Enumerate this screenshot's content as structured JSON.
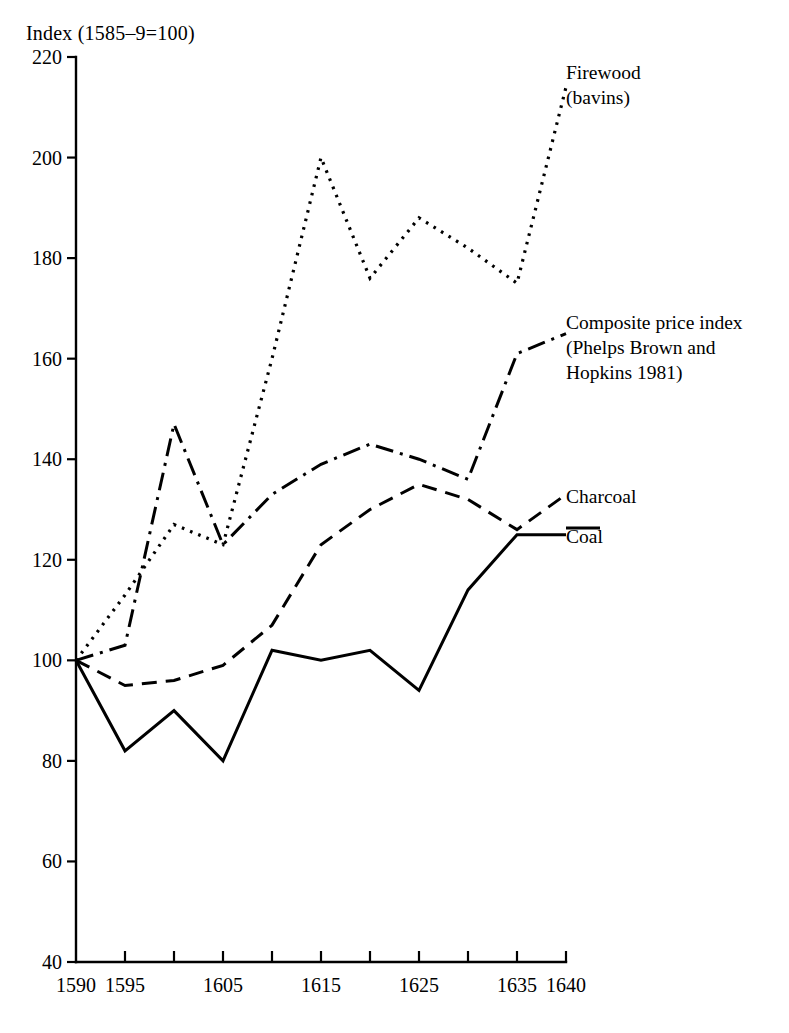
{
  "chart_data": {
    "type": "line",
    "title": "Index (1585–9=100)",
    "xlabel": "",
    "ylabel": "",
    "ylim": [
      40,
      220
    ],
    "xlim": [
      1590,
      1640
    ],
    "yticks": [
      40,
      60,
      80,
      100,
      120,
      140,
      160,
      180,
      200,
      220
    ],
    "ytick_labels": [
      "40",
      "60",
      "80",
      "100",
      "120",
      "140",
      "160",
      "180",
      "200",
      "220"
    ],
    "xticks": [
      1590,
      1595,
      1600,
      1605,
      1610,
      1615,
      1620,
      1625,
      1630,
      1635,
      1640
    ],
    "xtick_labels": [
      "1590",
      "1595",
      "",
      "1605",
      "",
      "1615",
      "",
      "1625",
      "",
      "1635",
      "1640"
    ],
    "grid": false,
    "legend_position": "right-inline-annotations",
    "x": [
      1590,
      1595,
      1600,
      1605,
      1610,
      1615,
      1620,
      1625,
      1630,
      1635,
      1640
    ],
    "series": [
      {
        "name": "Firewood (bavins)",
        "style": "dotted",
        "values": [
          100,
          113,
          127,
          123,
          160,
          200,
          176,
          188,
          182,
          175,
          214
        ]
      },
      {
        "name": "Composite price index (Phelps Brown and Hopkins 1981)",
        "style": "dash-dot",
        "values": [
          100,
          103,
          147,
          123,
          133,
          139,
          143,
          140,
          136,
          161,
          165
        ]
      },
      {
        "name": "Charcoal",
        "style": "dashed",
        "values": [
          100,
          95,
          96,
          99,
          107,
          123,
          130,
          135,
          132,
          126,
          133
        ]
      },
      {
        "name": "Coal",
        "style": "solid",
        "values": [
          100,
          82,
          90,
          80,
          102,
          100,
          102,
          94,
          114,
          125,
          125
        ]
      }
    ]
  },
  "labels": {
    "axis_title": "Index (1585–9=100)",
    "firewood_line1": "Firewood",
    "firewood_line2": "(bavins)",
    "composite_line1": "Composite price index",
    "composite_line2": "(Phelps Brown and",
    "composite_line3": "Hopkins 1981)",
    "charcoal": "Charcoal",
    "coal": "Coal"
  }
}
